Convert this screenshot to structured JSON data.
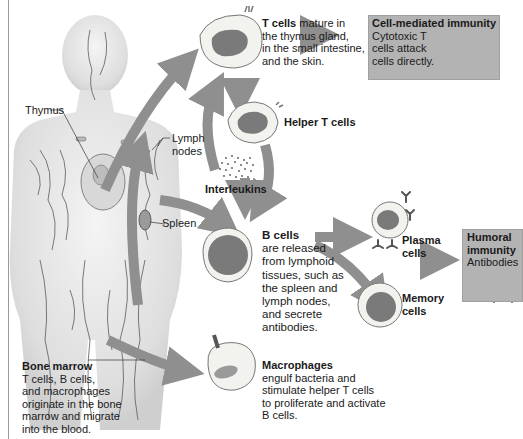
{
  "figure": {
    "colors": {
      "arrow": "#8f8f8f",
      "box_fill": "#b3b3b3",
      "cell_fill": "#f2f2ee",
      "nucleus": "#7a7a7a",
      "body": "#e6e6e6",
      "vessel": "#5a5a5a"
    }
  },
  "body_labels": {
    "thymus": "Thymus",
    "lymph_nodes_1": "Lymph",
    "lymph_nodes_2": "nodes",
    "spleen": "Spleen",
    "bone_marrow_title": "Bone marrow",
    "bone_marrow_lines": [
      "T cells, B cells,",
      "and macrophages",
      "originate in the bone",
      "marrow and migrate",
      "into the blood."
    ]
  },
  "t_cells": {
    "title": "T cells",
    "first_line_rest": " mature in",
    "lines": [
      "the thymus gland,",
      "in the small intestine,",
      "and the skin."
    ]
  },
  "cell_mediated": {
    "title": "Cell-mediated immunity",
    "lines": [
      "Cytotoxic T",
      "cells attack",
      "cells directly."
    ]
  },
  "helper_t": {
    "title": "Helper T cells"
  },
  "interleukins": {
    "title": "Interleukins"
  },
  "b_cells": {
    "title": "B cells",
    "lines": [
      "are released",
      "from lymphoid",
      "tissues, such as",
      "the spleen and",
      "lymph nodes,",
      "and secrete",
      "antibodies."
    ]
  },
  "plasma": {
    "line1": "Plasma",
    "line2": "cells"
  },
  "memory": {
    "line1": "Memory",
    "line2": "cells"
  },
  "humoral": {
    "title1": "Humoral",
    "title2": "immunity",
    "subtitle": "Antibodies"
  },
  "macrophages": {
    "title": "Macrophages",
    "lines": [
      "engulf bacteria and",
      "stimulate helper T cells",
      "to proliferate and activate",
      "B cells."
    ]
  }
}
